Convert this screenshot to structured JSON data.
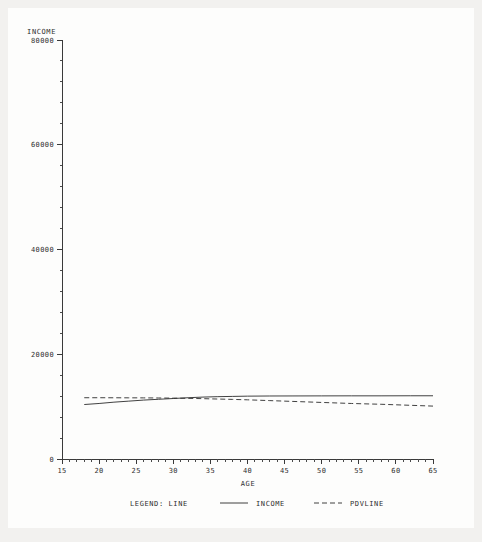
{
  "chart_data": {
    "type": "line",
    "title": "",
    "xlabel": "AGE",
    "ylabel": "INCOME",
    "xlim": [
      15,
      65
    ],
    "ylim": [
      0,
      80000
    ],
    "grid": false,
    "legend_position": "bottom",
    "legend_title": "LEGEND: LINE",
    "x_ticks": [
      15,
      20,
      25,
      30,
      35,
      40,
      45,
      50,
      55,
      60,
      65
    ],
    "x_tick_labels": [
      "15",
      "20",
      "25",
      "30",
      "35",
      "40",
      "45",
      "50",
      "55",
      "60",
      "65"
    ],
    "x_minor_tick_step": 1,
    "y_ticks": [
      0,
      20000,
      40000,
      60000,
      80000
    ],
    "y_tick_labels": [
      "0",
      "20000",
      "40000",
      "60000",
      "80000"
    ],
    "y_minor_tick_step": 4000,
    "series": [
      {
        "name": "INCOME",
        "style": "solid",
        "x": [
          18,
          20,
          22,
          24,
          26,
          28,
          30,
          32,
          34,
          36,
          38,
          40,
          43,
          46,
          50,
          54,
          58,
          62,
          65
        ],
        "values": [
          10400,
          10600,
          10850,
          11050,
          11250,
          11400,
          11550,
          11700,
          11820,
          11900,
          11950,
          12000,
          12030,
          12040,
          12050,
          12060,
          12060,
          12070,
          12070
        ]
      },
      {
        "name": "PDVLINE",
        "style": "dashed",
        "x": [
          18,
          20,
          22,
          24,
          26,
          28,
          30,
          32,
          34,
          36,
          38,
          40,
          43,
          46,
          50,
          54,
          58,
          62,
          65
        ],
        "values": [
          11700,
          11700,
          11690,
          11680,
          11670,
          11650,
          11620,
          11580,
          11520,
          11450,
          11380,
          11300,
          11150,
          11000,
          10800,
          10600,
          10450,
          10250,
          10100
        ]
      }
    ]
  },
  "axes": {
    "y_axis_title": "INCOME",
    "x_axis_title": "AGE"
  },
  "legend": {
    "label": "LEGEND: LINE",
    "entries": [
      {
        "name": "INCOME",
        "style": "solid"
      },
      {
        "name": "PDVLINE",
        "style": "dashed"
      }
    ]
  },
  "colors": {
    "ink": "#2b2b2b",
    "axis": "#3a3a3a",
    "page_background": "#f2f1ef",
    "figure_background": "#fdfdfc"
  }
}
